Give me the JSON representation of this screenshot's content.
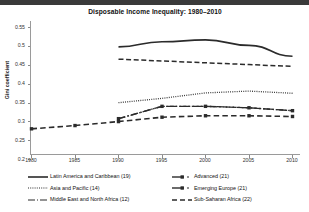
{
  "chart_data": {
    "type": "line",
    "title": "Disposable Income Inequality: 1980–2010",
    "xlabel": "",
    "ylabel": "Gini coefficient",
    "x": [
      1980,
      1985,
      1990,
      1995,
      2000,
      2005,
      2010
    ],
    "xtick_labels": [
      "1980",
      "1985",
      "1990",
      "1995",
      "2000",
      "2005",
      "2010"
    ],
    "ytick_labels": [
      "0.2",
      "0.25",
      "0.3",
      "0.35",
      "0.4",
      "0.45",
      "0.5",
      "0.55"
    ],
    "ytick_values": [
      0.2,
      0.25,
      0.3,
      0.35,
      0.4,
      0.45,
      0.5,
      0.55
    ],
    "ylim": [
      0.2,
      0.55
    ],
    "xlim": [
      1980,
      2010
    ],
    "grid": false,
    "legend_position": "below",
    "series": [
      {
        "name": "Latin America and Caribbean (19)",
        "count": 19,
        "style": "solid",
        "color": "#2b2b2b",
        "x": [
          1990,
          1995,
          2000,
          2005,
          2010
        ],
        "values": [
          0.494,
          0.508,
          0.513,
          0.498,
          0.468
        ]
      },
      {
        "name": "Asia and Pacific (14)",
        "count": 14,
        "style": "dotted",
        "color": "#2b2b2b",
        "x": [
          1990,
          1995,
          2000,
          2005,
          2010
        ],
        "values": [
          0.34,
          0.352,
          0.367,
          0.372,
          0.366
        ]
      },
      {
        "name": "Middle East and North Africa (12)",
        "count": 12,
        "style": "dash-dot",
        "color": "#2b2b2b",
        "x": [
          1990,
          1995,
          2000,
          2005,
          2010
        ],
        "values": [
          0.296,
          0.33,
          0.33,
          0.326,
          0.318
        ]
      },
      {
        "name": "Advanced (21)",
        "count": 21,
        "style": "dashed-marker",
        "color": "#2b2b2b",
        "x": [
          1990,
          1995,
          2000,
          2005,
          2010
        ],
        "values": [
          0.46,
          0.455,
          0.45,
          0.445,
          0.44
        ]
      },
      {
        "name": "Emerging Europe (21)",
        "count": 21,
        "style": "dash-dot-marker",
        "color": "#2b2b2b",
        "x": [
          1990,
          1995,
          2000,
          2005,
          2010
        ],
        "values": [
          0.296,
          0.33,
          0.33,
          0.326,
          0.318
        ]
      },
      {
        "name": "Sub-Saharan Africa (22)",
        "count": 22,
        "style": "long-dashed",
        "color": "#2b2b2b",
        "x": [
          1980,
          1985,
          1990,
          1995,
          2000,
          2005,
          2010
        ],
        "values": [
          0.268,
          0.277,
          0.288,
          0.3,
          0.304,
          0.304,
          0.302
        ]
      }
    ]
  }
}
